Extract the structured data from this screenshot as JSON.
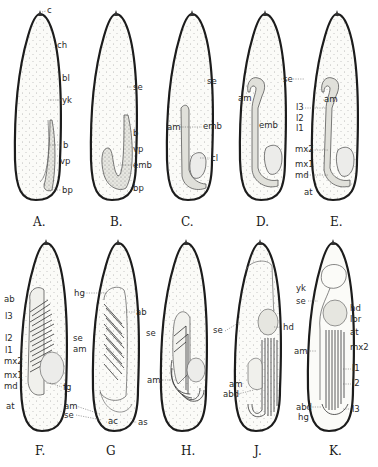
{
  "figure": {
    "type": "embryo-development-stages",
    "panels": [
      {
        "id": "A",
        "caption": "A.",
        "labels": [
          "c",
          "ch",
          "bl",
          "yk",
          "b",
          "vp",
          "bp"
        ]
      },
      {
        "id": "B",
        "caption": "B.",
        "labels": [
          "se",
          "b",
          "vp",
          "emb",
          "bp"
        ]
      },
      {
        "id": "C",
        "caption": "C.",
        "labels": [
          "se",
          "am",
          "emb",
          "cl"
        ]
      },
      {
        "id": "D",
        "caption": "D.",
        "labels": [
          "se",
          "am",
          "emb"
        ]
      },
      {
        "id": "E",
        "caption": "E.",
        "labels": [
          "am",
          "l3",
          "l2",
          "l1",
          "mx2",
          "mx1",
          "md",
          "at"
        ]
      },
      {
        "id": "F",
        "caption": "F.",
        "labels": [
          "ab",
          "l3",
          "l2",
          "l1",
          "mx2",
          "mx1",
          "md",
          "at",
          "fg"
        ]
      },
      {
        "id": "G",
        "caption": "G",
        "labels": [
          "hg",
          "ab",
          "se",
          "am",
          "am",
          "se",
          "ac",
          "as"
        ]
      },
      {
        "id": "H",
        "caption": "H.",
        "labels": [
          "se",
          "am"
        ]
      },
      {
        "id": "J",
        "caption": "J.",
        "labels": [
          "se",
          "hd",
          "am",
          "abd"
        ]
      },
      {
        "id": "K",
        "caption": "K.",
        "labels": [
          "yk",
          "se",
          "hd",
          "lbr",
          "at",
          "mx2",
          "am",
          "l1",
          "l2",
          "l3",
          "abd",
          "hg"
        ]
      }
    ]
  },
  "text": {
    "A": {
      "cap": "A.",
      "c": "c",
      "ch": "ch",
      "bl": "bl",
      "yk": "yk",
      "b": "b",
      "vp": "vp",
      "bp": "bp"
    },
    "B": {
      "cap": "B.",
      "se": "se",
      "b": "b",
      "vp": "vp",
      "emb": "emb",
      "bp": "bp"
    },
    "C": {
      "cap": "C.",
      "se": "se",
      "am": "am",
      "emb": "emb",
      "cl": "cl"
    },
    "D": {
      "cap": "D.",
      "se": "se",
      "am": "am",
      "emb": "emb"
    },
    "E": {
      "cap": "E.",
      "am": "am",
      "l3": "l3",
      "l2": "l2",
      "l1": "l1",
      "mx2": "mx2",
      "mx1": "mx1",
      "md": "md",
      "at": "at"
    },
    "F": {
      "cap": "F.",
      "ab": "ab",
      "l3": "l3",
      "l2": "l2",
      "l1": "l1",
      "mx2": "mx2",
      "mx1": "mx1",
      "md": "md",
      "at": "at",
      "fg": "fg"
    },
    "G": {
      "cap": "G",
      "hg": "hg",
      "ab": "ab",
      "se": "se",
      "am": "am",
      "am2": "am",
      "se2": "se",
      "ac": "ac",
      "as": "as"
    },
    "H": {
      "cap": "H.",
      "se": "se",
      "am": "am"
    },
    "J": {
      "cap": "J.",
      "se": "se",
      "hd": "hd",
      "am": "am",
      "abd": "abd"
    },
    "K": {
      "cap": "K.",
      "yk": "yk",
      "se": "se",
      "hd": "hd",
      "lbr": "lbr",
      "at": "at",
      "mx2": "mx2",
      "am": "am",
      "l1": "l1",
      "l2": "l2",
      "l3": "l3",
      "abd": "abd",
      "hg": "hg"
    }
  }
}
